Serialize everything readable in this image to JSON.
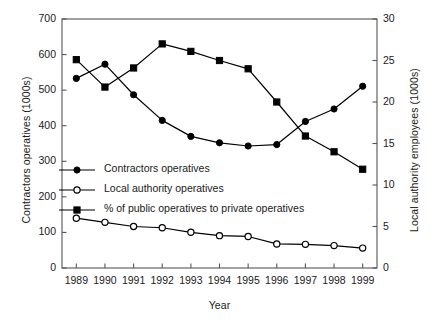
{
  "chart_data": {
    "type": "line",
    "title": "",
    "xlabel": "Year",
    "ylabel": "Contractors operatives (1000s)",
    "ylabel_right": "Local authority employees (1000s)",
    "categories": [
      "1989",
      "1990",
      "1991",
      "1992",
      "1993",
      "1994",
      "1995",
      "1996",
      "1997",
      "1998",
      "1999"
    ],
    "x_tick_labels": [
      "1989",
      "1990",
      "1991",
      "1992",
      "1993",
      "1994",
      "1995",
      "1996",
      "1997",
      "1998",
      "1999"
    ],
    "y_tick_labels_left": [
      "0",
      "100",
      "200",
      "300",
      "400",
      "500",
      "600",
      "700"
    ],
    "y_tick_values_left": [
      0,
      100,
      200,
      300,
      400,
      500,
      600,
      700
    ],
    "y_tick_labels_right": [
      "0",
      "5",
      "10",
      "15",
      "20",
      "25",
      "30"
    ],
    "y_tick_values_right": [
      0,
      5,
      10,
      15,
      20,
      25,
      30
    ],
    "ylim": [
      0,
      700
    ],
    "ylim_right": [
      0,
      30
    ],
    "grid": false,
    "legend_position": "center-left-inside",
    "series": [
      {
        "name": "Contractors operatives",
        "axis": "left",
        "marker": "filled-circle",
        "color": "#000000",
        "values": [
          533,
          573,
          487,
          415,
          370,
          352,
          343,
          347,
          412,
          447,
          511
        ]
      },
      {
        "name": "Local authority operatives",
        "axis": "right",
        "marker": "open-circle",
        "color": "#000000",
        "values": [
          6.0,
          5.5,
          5.0,
          4.85,
          4.3,
          3.9,
          3.8,
          2.9,
          2.85,
          2.7,
          2.4
        ]
      },
      {
        "name": "% of public operatives to private operatives",
        "axis": "right",
        "marker": "filled-square",
        "color": "#000000",
        "values": [
          25.1,
          21.8,
          24.1,
          27.0,
          26.1,
          25.0,
          24.0,
          20.0,
          15.9,
          14.0,
          11.9
        ]
      }
    ]
  },
  "legend": {
    "items": [
      {
        "label": "Contractors operatives",
        "marker": "filled-circle"
      },
      {
        "label": "Local authority operatives",
        "marker": "open-circle"
      },
      {
        "label": "% of public operatives to private operatives",
        "marker": "filled-square"
      }
    ]
  },
  "colors": {
    "ink": "#1a1a1a",
    "line": "#000000",
    "axis": "#555555",
    "background": "#ffffff"
  }
}
